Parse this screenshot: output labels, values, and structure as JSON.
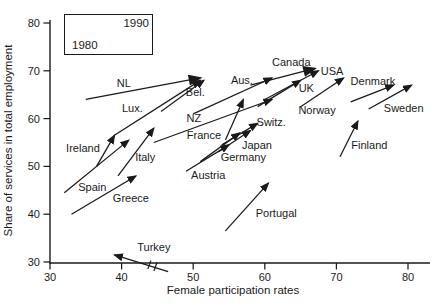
{
  "axes": {
    "x": {
      "label": "Female participation rates",
      "ticks": [
        30,
        40,
        50,
        60,
        70,
        80
      ],
      "range": [
        30,
        83
      ]
    },
    "y": {
      "label": "Share of services in total employment",
      "ticks": [
        30,
        40,
        50,
        60,
        70,
        80
      ],
      "range": [
        30,
        80
      ]
    }
  },
  "legend": {
    "start_label": "1980",
    "end_label": "1990"
  },
  "colors": {
    "ink": "#1a1a1a",
    "background": "#ffffff"
  },
  "chart_data": {
    "type": "scatter",
    "representation": "arrows from 1980 position to 1990 position per country",
    "title": "",
    "xlabel": "Female participation rates",
    "ylabel": "Share of services in total employment",
    "xlim": [
      30,
      83
    ],
    "ylim": [
      30,
      80
    ],
    "grid": false,
    "countries": [
      {
        "name": "NL",
        "from": [
          35,
          64
        ],
        "to": [
          51,
          68.5
        ],
        "label": [
          40.3,
          67.4
        ],
        "big_head": true
      },
      {
        "name": "Lux.",
        "from": [
          39,
          56.5
        ],
        "to": [
          51,
          68
        ],
        "label": [
          41.5,
          62.2
        ]
      },
      {
        "name": "Bel.",
        "from": [
          45.5,
          61.5
        ],
        "to": [
          51.5,
          68
        ],
        "label": [
          50.3,
          65.6
        ]
      },
      {
        "name": "Ireland",
        "from": [
          36.5,
          50
        ],
        "to": [
          39,
          56.5
        ],
        "label": [
          34.6,
          53.8
        ]
      },
      {
        "name": "Italy",
        "from": [
          39.5,
          48
        ],
        "to": [
          44.5,
          58
        ],
        "label": [
          43.3,
          52
        ]
      },
      {
        "name": "Spain",
        "from": [
          32,
          44.5
        ],
        "to": [
          41,
          55.5
        ],
        "label": [
          35.9,
          45.7
        ]
      },
      {
        "name": "Greece",
        "from": [
          33,
          40
        ],
        "to": [
          42,
          48
        ],
        "label": [
          41.3,
          43.4
        ]
      },
      {
        "name": "NZ",
        "from": [
          44.5,
          55
        ],
        "to": [
          61,
          64
        ],
        "label": [
          50.1,
          60.1
        ]
      },
      {
        "name": "France",
        "from": [
          54.5,
          55.5
        ],
        "to": [
          57,
          64
        ],
        "label": [
          51.5,
          56.6
        ]
      },
      {
        "name": "Austria",
        "from": [
          49,
          49
        ],
        "to": [
          55,
          54.5
        ],
        "label": [
          52.1,
          48.2
        ]
      },
      {
        "name": "Germany",
        "from": [
          51,
          51
        ],
        "to": [
          56.5,
          57
        ],
        "label": [
          57,
          52
        ]
      },
      {
        "name": "Japan",
        "from": [
          53.5,
          53
        ],
        "to": [
          58,
          57.5
        ],
        "label": [
          58.9,
          54.5
        ]
      },
      {
        "name": "Switz.",
        "from": [
          54,
          54.5
        ],
        "to": [
          59,
          59
        ],
        "label": [
          60.9,
          59.3
        ]
      },
      {
        "name": "Aus.",
        "from": [
          50,
          61
        ],
        "to": [
          61,
          68.5
        ],
        "label": [
          56.8,
          68.1
        ]
      },
      {
        "name": "Canada",
        "from": [
          58,
          67
        ],
        "to": [
          67,
          70.5
        ],
        "label": [
          63.7,
          71.8
        ],
        "big_head": true
      },
      {
        "name": "USA",
        "from": [
          60,
          64
        ],
        "to": [
          67.5,
          70
        ],
        "label": [
          69.4,
          70
        ]
      },
      {
        "name": "UK",
        "from": [
          59,
          62.5
        ],
        "to": [
          65,
          68
        ],
        "label": [
          65.8,
          66.4
        ]
      },
      {
        "name": "Norway",
        "from": [
          65,
          62.5
        ],
        "to": [
          71,
          68.5
        ],
        "label": [
          67.3,
          61.8
        ]
      },
      {
        "name": "Denmark",
        "from": [
          72,
          63.5
        ],
        "to": [
          78,
          67
        ],
        "label": [
          75.1,
          67.9
        ]
      },
      {
        "name": "Sweden",
        "from": [
          74.5,
          62
        ],
        "to": [
          80.5,
          67
        ],
        "label": [
          79.4,
          62.2
        ]
      },
      {
        "name": "Finland",
        "from": [
          70.5,
          52
        ],
        "to": [
          73,
          59.5
        ],
        "label": [
          74.6,
          54.5
        ]
      },
      {
        "name": "Portugal",
        "from": [
          54.5,
          36.5
        ],
        "to": [
          60.5,
          46.5
        ],
        "label": [
          61.6,
          40.3
        ]
      },
      {
        "name": "Turkey",
        "from": [
          46.5,
          28
        ],
        "to": [
          39,
          31.5
        ],
        "label": [
          44.5,
          33.1
        ],
        "break_mark": [
          44.3,
          29.2
        ]
      }
    ]
  }
}
